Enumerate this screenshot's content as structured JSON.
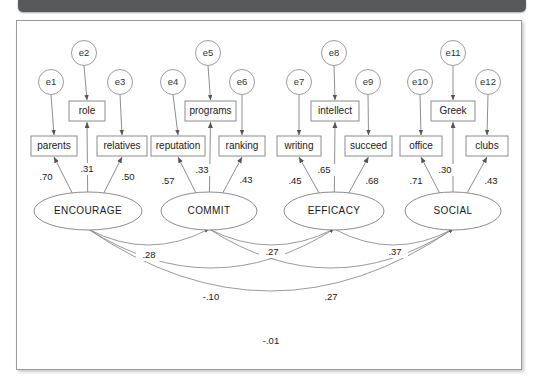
{
  "figure": {
    "type": "sem-path-diagram"
  },
  "chart_data": {
    "type": "diagram",
    "title": "",
    "errors": [
      {
        "id": "e1",
        "label": "e1",
        "cx": 50,
        "cy": 81,
        "r": 12.5
      },
      {
        "id": "e2",
        "label": "e2",
        "cx": 83,
        "cy": 52,
        "r": 12.5
      },
      {
        "id": "e3",
        "label": "e3",
        "cx": 119,
        "cy": 81,
        "r": 12.5
      },
      {
        "id": "e4",
        "label": "e4",
        "cx": 172,
        "cy": 81,
        "r": 12.5
      },
      {
        "id": "e5",
        "label": "e5",
        "cx": 207,
        "cy": 52,
        "r": 12.5
      },
      {
        "id": "e6",
        "label": "e6",
        "cx": 241,
        "cy": 81,
        "r": 12.5
      },
      {
        "id": "e7",
        "label": "e7",
        "cx": 298,
        "cy": 81,
        "r": 12.5
      },
      {
        "id": "e8",
        "label": "e8",
        "cx": 333,
        "cy": 52,
        "r": 12.5
      },
      {
        "id": "e9",
        "label": "e9",
        "cx": 367,
        "cy": 81,
        "r": 12.5
      },
      {
        "id": "e10",
        "label": "e10",
        "cx": 419,
        "cy": 81,
        "r": 12.5
      },
      {
        "id": "e11",
        "label": "e11",
        "cx": 452,
        "cy": 52,
        "r": 12.5
      },
      {
        "id": "e12",
        "label": "e12",
        "cx": 487,
        "cy": 81,
        "r": 12.5
      }
    ],
    "observed": [
      {
        "id": "parents",
        "label": "parents",
        "x": 30,
        "y": 135,
        "w": 46,
        "h": 20
      },
      {
        "id": "role",
        "label": "role",
        "x": 68,
        "y": 100,
        "w": 36,
        "h": 20
      },
      {
        "id": "relatives",
        "label": "relatives",
        "x": 96,
        "y": 135,
        "w": 50,
        "h": 20
      },
      {
        "id": "reputation",
        "label": "reputation",
        "x": 150,
        "y": 135,
        "w": 54,
        "h": 20
      },
      {
        "id": "programs",
        "label": "programs",
        "x": 184,
        "y": 100,
        "w": 51,
        "h": 20
      },
      {
        "id": "ranking",
        "label": "ranking",
        "x": 218,
        "y": 135,
        "w": 46,
        "h": 20
      },
      {
        "id": "writing",
        "label": "writing",
        "x": 276,
        "y": 135,
        "w": 44,
        "h": 20
      },
      {
        "id": "intellect",
        "label": "intellect",
        "x": 310,
        "y": 100,
        "w": 48,
        "h": 20
      },
      {
        "id": "succeed",
        "label": "succeed",
        "x": 344,
        "y": 135,
        "w": 47,
        "h": 20
      },
      {
        "id": "office",
        "label": "office",
        "x": 399,
        "y": 135,
        "w": 42,
        "h": 20
      },
      {
        "id": "Greek",
        "label": "Greek",
        "x": 430,
        "y": 100,
        "w": 44,
        "h": 20
      },
      {
        "id": "clubs",
        "label": "clubs",
        "x": 465,
        "y": 135,
        "w": 42,
        "h": 20
      }
    ],
    "latents": [
      {
        "id": "ENCOURAGE",
        "label": "ENCOURAGE",
        "cx": 87,
        "cy": 210,
        "rx": 54,
        "ry": 19
      },
      {
        "id": "COMMIT",
        "label": "COMMIT",
        "cx": 208,
        "cy": 210,
        "rx": 48,
        "ry": 19
      },
      {
        "id": "EFFICACY",
        "label": "EFFICACY",
        "cx": 333,
        "cy": 210,
        "rx": 50,
        "ry": 19
      },
      {
        "id": "SOCIAL",
        "label": "SOCIAL",
        "cx": 452,
        "cy": 210,
        "rx": 48,
        "ry": 19
      }
    ],
    "loadings": [
      {
        "from": "ENCOURAGE",
        "to": "parents",
        "value": ".70",
        "lx": 45,
        "ly": 176
      },
      {
        "from": "ENCOURAGE",
        "to": "role",
        "value": ".31",
        "lx": 86,
        "ly": 168
      },
      {
        "from": "ENCOURAGE",
        "to": "relatives",
        "value": ".50",
        "lx": 127,
        "ly": 176
      },
      {
        "from": "COMMIT",
        "to": "reputation",
        "value": ".57",
        "lx": 167,
        "ly": 180
      },
      {
        "from": "COMMIT",
        "to": "programs",
        "value": ".33",
        "lx": 201,
        "ly": 169
      },
      {
        "from": "COMMIT",
        "to": "ranking",
        "value": ".43",
        "lx": 245,
        "ly": 179
      },
      {
        "from": "EFFICACY",
        "to": "writing",
        "value": ".45",
        "lx": 294,
        "ly": 180
      },
      {
        "from": "EFFICACY",
        "to": "intellect",
        "value": ".65",
        "lx": 323,
        "ly": 169
      },
      {
        "from": "EFFICACY",
        "to": "succeed",
        "value": ".68",
        "lx": 371,
        "ly": 180
      },
      {
        "from": "SOCIAL",
        "to": "office",
        "value": ".71",
        "lx": 415,
        "ly": 180
      },
      {
        "from": "SOCIAL",
        "to": "Greek",
        "value": ".30",
        "lx": 444,
        "ly": 169
      },
      {
        "from": "SOCIAL",
        "to": "clubs",
        "value": ".43",
        "lx": 490,
        "ly": 180
      }
    ],
    "covariances": [
      {
        "from": "ENCOURAGE",
        "to": "COMMIT",
        "value": ".28",
        "lx": 148,
        "ly": 254
      },
      {
        "from": "COMMIT",
        "to": "EFFICACY",
        "value": ".27",
        "lx": 271,
        "ly": 251
      },
      {
        "from": "EFFICACY",
        "to": "SOCIAL",
        "value": ".37",
        "lx": 394,
        "ly": 251
      },
      {
        "from": "ENCOURAGE",
        "to": "EFFICACY",
        "value": "-.10",
        "lx": 210,
        "ly": 296
      },
      {
        "from": "COMMIT",
        "to": "SOCIAL",
        "value": ".27",
        "lx": 330,
        "ly": 296
      },
      {
        "from": "ENCOURAGE",
        "to": "SOCIAL",
        "value": "-.01",
        "lx": 270,
        "ly": 340
      }
    ],
    "notes": {
      "factor_count": 4,
      "indicator_count": 12,
      "error_count": 12,
      "covariance_count": 6
    }
  }
}
